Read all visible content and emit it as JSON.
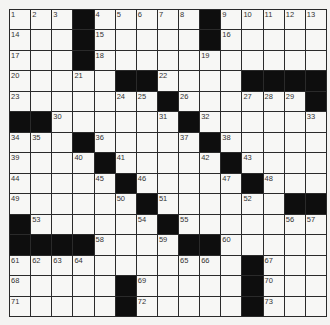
{
  "puzzle": {
    "rows": 15,
    "cols": 15,
    "colors": {
      "black": "#0e0e0e",
      "white": "#f7f7f5",
      "line": "#2a2a2a"
    },
    "grid": [
      [
        "1",
        "2",
        "3",
        "#",
        "4",
        "5",
        "6",
        "7",
        "8",
        "#",
        "9",
        "10",
        "11",
        "12",
        "13"
      ],
      [
        "14",
        "",
        "",
        "#",
        "15",
        "",
        "",
        "",
        "",
        "#",
        "16",
        "",
        "",
        "",
        ""
      ],
      [
        "17",
        "",
        "",
        "#",
        "18",
        "",
        "",
        "",
        "",
        "19",
        "",
        "",
        "",
        "",
        ""
      ],
      [
        "20",
        "",
        "",
        "21",
        "",
        "#",
        "#",
        "22",
        "",
        "",
        "",
        "#",
        "#",
        "#",
        "#"
      ],
      [
        "23",
        "",
        "",
        "",
        "",
        "24",
        "25",
        "#",
        "26",
        "",
        "",
        "27",
        "28",
        "29",
        "#"
      ],
      [
        "#",
        "#",
        "30",
        "",
        "",
        "",
        "",
        "31",
        "#",
        "32",
        "",
        "",
        "",
        "",
        "33"
      ],
      [
        "34",
        "35",
        "",
        "#",
        "36",
        "",
        "",
        "",
        "37",
        "#",
        "38",
        "",
        "",
        "",
        ""
      ],
      [
        "39",
        "",
        "",
        "40",
        "#",
        "41",
        "",
        "",
        "",
        "42",
        "#",
        "43",
        "",
        "",
        ""
      ],
      [
        "44",
        "",
        "",
        "",
        "45",
        "#",
        "46",
        "",
        "",
        "",
        "47",
        "#",
        "48",
        "",
        ""
      ],
      [
        "49",
        "",
        "",
        "",
        "",
        "50",
        "#",
        "51",
        "",
        "",
        "",
        "52",
        "",
        "#",
        "#"
      ],
      [
        "#",
        "53",
        "",
        "",
        "",
        "",
        "54",
        "#",
        "55",
        "",
        "",
        "",
        "",
        "56",
        "57"
      ],
      [
        "#",
        "#",
        "#",
        "#",
        "58",
        "",
        "",
        "59",
        "#",
        "#",
        "60",
        "",
        "",
        "",
        ""
      ],
      [
        "61",
        "62",
        "63",
        "64",
        "",
        "",
        "",
        "",
        "65",
        "66",
        "",
        "#",
        "67",
        "",
        ""
      ],
      [
        "68",
        "",
        "",
        "",
        "",
        "#",
        "69",
        "",
        "",
        "",
        "",
        "#",
        "70",
        "",
        ""
      ],
      [
        "71",
        "",
        "",
        "",
        "",
        "#",
        "72",
        "",
        "",
        "",
        "",
        "#",
        "73",
        "",
        ""
      ]
    ]
  }
}
